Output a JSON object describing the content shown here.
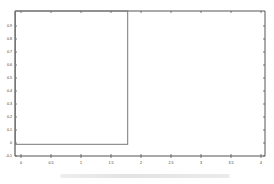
{
  "chart_data": {
    "type": "scatter",
    "title": "",
    "xlabel": "",
    "ylabel": "",
    "xlim": [
      -0.1,
      4.05
    ],
    "ylim": [
      -0.1,
      1.0
    ],
    "x_ticks": [
      0,
      0.5,
      1,
      1.5,
      2,
      2.5,
      3,
      3.5,
      4
    ],
    "x_tick_labels": [
      "0",
      "0.5",
      "1",
      "1.5",
      "2",
      "2.5",
      "3",
      "3.5",
      "4"
    ],
    "y_ticks": [
      -0.1,
      0,
      0.1,
      0.2,
      0.3,
      0.4,
      0.5,
      0.6,
      0.7,
      0.8,
      0.9
    ],
    "y_tick_labels": [
      "-0.1",
      "0",
      "0.1",
      "0.2",
      "0.3",
      "0.4",
      "0.5",
      "0.6",
      "0.7",
      "0.8",
      "0.9"
    ],
    "grid": false,
    "legend_position": "upper right",
    "series": [
      {
        "name": "Data points",
        "marker": "plus",
        "x": [
          0.98,
          1.52,
          1.93,
          2.52,
          3.0,
          3.52,
          4.0
        ],
        "y": [
          0.65,
          0.73,
          0.69,
          0.58,
          0.5,
          0.52,
          0.72
        ]
      },
      {
        "name": "Middle point",
        "marker": "triangle",
        "x": [
          0.53,
          1.87
        ],
        "y": [
          0.42,
          0.7
        ]
      },
      {
        "name": "Particle Swarm",
        "marker": "dot",
        "x": [
          0.0,
          0.27,
          0.47,
          0.53,
          0.5,
          0.77,
          0.77,
          0.93,
          0.57,
          1.35,
          1.35,
          1.65,
          -0.08
        ],
        "y": [
          0.0,
          0.47,
          0.45,
          0.23,
          0.88,
          0.95,
          0.76,
          0.74,
          0.59,
          0.88,
          0.22,
          0.84,
          0.75
        ]
      }
    ],
    "annotations": [
      {
        "text": "Search space",
        "x": 1.95,
        "y": 0.87,
        "arrow_to": [
          1.75,
          0.76
        ]
      }
    ],
    "regions": [
      {
        "name": "search-space-box",
        "x0": -0.1,
        "x1": 1.77,
        "y0": -0.01,
        "y1": 1.0
      }
    ]
  },
  "legend": {
    "items": [
      "Data points",
      "Middle point",
      "Particle Swarm"
    ]
  },
  "colors": {
    "axis": "#555555",
    "marker": "#222222",
    "box": "#777777",
    "text": "#333333"
  }
}
